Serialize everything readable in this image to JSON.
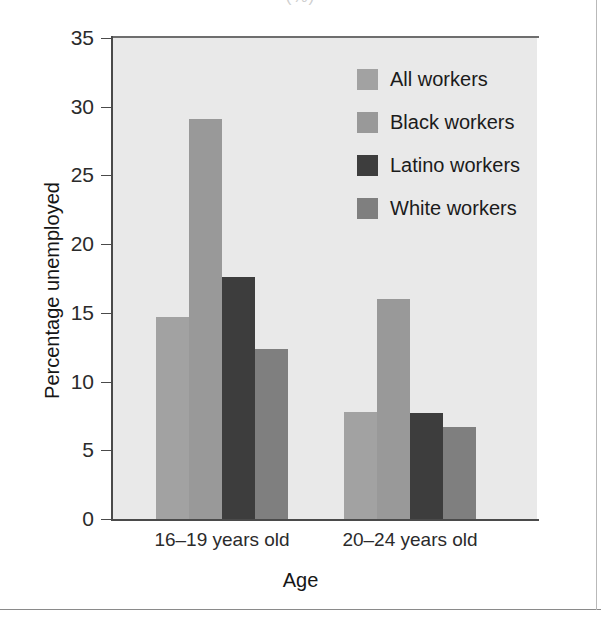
{
  "figure": {
    "caption_fragment": "(%)",
    "background_color": "#ffffff",
    "plot_background_color": "#e9e9e9",
    "frame_color": "#8a8a8a"
  },
  "chart_data": {
    "type": "bar",
    "title": "",
    "subtitle": "",
    "xlabel": "Age",
    "ylabel": "Percentage unemployed",
    "categories": [
      "16–19 years old",
      "20–24 years old"
    ],
    "series": [
      {
        "name": "All workers",
        "color": "#a2a2a2",
        "values": [
          14.7,
          7.8
        ]
      },
      {
        "name": "Black workers",
        "color": "#999999",
        "values": [
          29.1,
          16.0
        ]
      },
      {
        "name": "Latino workers",
        "color": "#3d3d3d",
        "values": [
          17.6,
          7.7
        ]
      },
      {
        "name": "White workers",
        "color": "#7f7f7f",
        "values": [
          12.4,
          6.7
        ]
      }
    ],
    "ylim": [
      0,
      35
    ],
    "yticks": [
      0,
      5,
      10,
      15,
      20,
      25,
      30,
      35
    ],
    "ytick_labels": [
      "0",
      "5",
      "10",
      "15",
      "20",
      "25",
      "30",
      "35"
    ],
    "grid": false,
    "legend_position": "upper-right-inside"
  },
  "legend": {
    "items": [
      {
        "label": "All workers",
        "color": "#a2a2a2"
      },
      {
        "label": "Black workers",
        "color": "#999999"
      },
      {
        "label": "Latino workers",
        "color": "#3d3d3d"
      },
      {
        "label": "White workers",
        "color": "#7f7f7f"
      }
    ]
  }
}
